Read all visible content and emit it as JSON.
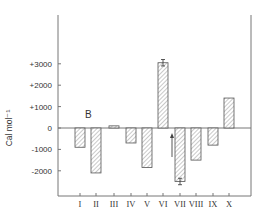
{
  "chart_data": {
    "type": "bar",
    "title": "",
    "panel_label": "B",
    "xlabel": "",
    "ylabel": "Cal mol⁻¹",
    "ylim": [
      -3200,
      5200
    ],
    "yticks": [
      3000,
      2000,
      1000,
      0,
      -1000,
      -2000
    ],
    "ytick_labels": [
      "+3000",
      "+2000",
      "+1000",
      "0",
      "-1000",
      "-2000"
    ],
    "categories": [
      "I",
      "II",
      "III",
      "IV",
      "V",
      "VI",
      "VII",
      "VIII",
      "IX",
      "X"
    ],
    "values": [
      -900,
      -2100,
      100,
      -700,
      -1850,
      3050,
      -2500,
      -1500,
      -800,
      1400
    ],
    "error_bars": {
      "VI": 150,
      "VII": 150
    },
    "annotations": [
      {
        "type": "arrow-up",
        "near": "VII",
        "text": ""
      }
    ],
    "grid": false,
    "legend": null,
    "bar_fill": "diagonal-hatch"
  }
}
